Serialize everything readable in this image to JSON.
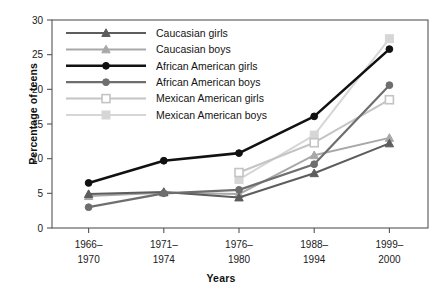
{
  "chart_data": {
    "type": "line",
    "title": "",
    "xlabel": "Years",
    "ylabel": "Percentage of teens",
    "categories": [
      "1966–\n1970",
      "1971–\n1974",
      "1976–\n1980",
      "1988–\n1994",
      "1999–\n2000"
    ],
    "category_lines": [
      [
        "1966–",
        "1970"
      ],
      [
        "1971–",
        "1974"
      ],
      [
        "1976–",
        "1980"
      ],
      [
        "1988–",
        "1994"
      ],
      [
        "1999–",
        "2000"
      ]
    ],
    "ylim": [
      0,
      30
    ],
    "yticks": [
      0,
      5,
      10,
      15,
      20,
      25,
      30
    ],
    "ytick_labels": [
      "0",
      "5",
      "10",
      "15",
      "20",
      "25",
      "30"
    ],
    "grid": false,
    "legend_position": "upper-left-inside",
    "series": [
      {
        "name": "Caucasian girls",
        "marker": "triangle",
        "color": "#5d5d5d",
        "fill": "#5d5d5d",
        "line_width": 2.0,
        "values": [
          4.9,
          5.2,
          4.4,
          7.9,
          12.2
        ]
      },
      {
        "name": "Caucasian boys",
        "marker": "triangle",
        "color": "#a8a8a8",
        "fill": "#a8a8a8",
        "line_width": 2.0,
        "values": [
          4.6,
          5.1,
          4.9,
          10.5,
          13.0
        ]
      },
      {
        "name": "African American girls",
        "marker": "circle",
        "color": "#111111",
        "fill": "#111111",
        "line_width": 2.6,
        "values": [
          6.5,
          9.7,
          10.8,
          16.1,
          25.8
        ]
      },
      {
        "name": "African American boys",
        "marker": "circle",
        "color": "#6e6e6e",
        "fill": "#6e6e6e",
        "line_width": 2.2,
        "values": [
          3.0,
          5.0,
          5.5,
          9.2,
          20.6
        ]
      },
      {
        "name": "Mexican American girls",
        "marker": "open-square",
        "color": "#c4c4c4",
        "fill": "#ffffff",
        "line_width": 2.0,
        "values": [
          null,
          null,
          8.0,
          12.3,
          18.5
        ]
      },
      {
        "name": "Mexican American boys",
        "marker": "filled-square",
        "color": "#d6d6d6",
        "fill": "#d6d6d6",
        "line_width": 2.0,
        "values": [
          null,
          null,
          7.0,
          13.4,
          27.3
        ]
      }
    ]
  },
  "axis": {
    "y_title": "Percentage of teens",
    "x_title": "Years"
  },
  "colors": {
    "background": "#ffffff",
    "axis": "#555555",
    "text": "#1a1a1a"
  }
}
